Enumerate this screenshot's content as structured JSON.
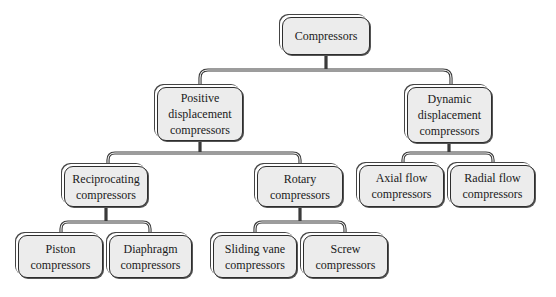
{
  "diagram": {
    "type": "tree",
    "colors": {
      "node_fill": "#ececec",
      "node_border": "#2e2e2e",
      "connector": "#3a3a3a",
      "background": "#ffffff"
    },
    "root": {
      "id": "compressors",
      "label": "Compressors"
    },
    "nodes": {
      "compressors": {
        "line1": "Compressors"
      },
      "positive": {
        "line1": "Positive",
        "line2": "displacement",
        "line3": "compressors"
      },
      "dynamic": {
        "line1": "Dynamic",
        "line2": "displacement",
        "line3": "compressors"
      },
      "reciprocating": {
        "line1": "Reciprocating",
        "line2": "compressors"
      },
      "rotary": {
        "line1": "Rotary",
        "line2": "compressors"
      },
      "axial": {
        "line1": "Axial flow",
        "line2": "compressors"
      },
      "radial": {
        "line1": "Radial flow",
        "line2": "compressors"
      },
      "piston": {
        "line1": "Piston",
        "line2": "compressors"
      },
      "diaphragm": {
        "line1": "Diaphragm",
        "line2": "compressors"
      },
      "sliding_vane": {
        "line1": "Sliding vane",
        "line2": "compressors"
      },
      "screw": {
        "line1": "Screw",
        "line2": "compressors"
      }
    },
    "edges": [
      [
        "compressors",
        "positive"
      ],
      [
        "compressors",
        "dynamic"
      ],
      [
        "positive",
        "reciprocating"
      ],
      [
        "positive",
        "rotary"
      ],
      [
        "dynamic",
        "axial"
      ],
      [
        "dynamic",
        "radial"
      ],
      [
        "reciprocating",
        "piston"
      ],
      [
        "reciprocating",
        "diaphragm"
      ],
      [
        "rotary",
        "sliding_vane"
      ],
      [
        "rotary",
        "screw"
      ]
    ]
  }
}
